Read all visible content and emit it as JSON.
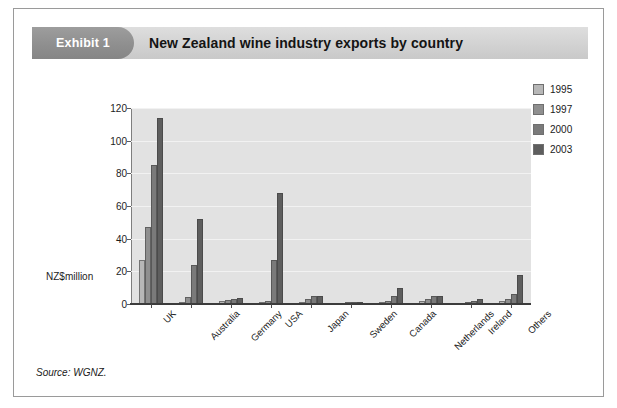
{
  "exhibit": {
    "badge_label": "Exhibit 1",
    "title": "New Zealand wine industry exports by country",
    "source": "Source: WGNZ."
  },
  "chart_data": {
    "type": "bar",
    "title": "New Zealand wine industry exports by country",
    "xlabel": "",
    "ylabel": "NZ$million",
    "ylim": [
      0,
      120
    ],
    "yticks": [
      0,
      20,
      40,
      60,
      80,
      100,
      120
    ],
    "grid": true,
    "legend_position": "right",
    "categories": [
      "UK",
      "Australia",
      "Germany",
      "USA",
      "Japan",
      "Sweden",
      "Canada",
      "Netherlands",
      "Ireland",
      "Others"
    ],
    "series": [
      {
        "name": "1995",
        "color": "#b7b7b7",
        "values": [
          27,
          1.5,
          2,
          1.5,
          1,
          0.5,
          1,
          2,
          0.5,
          2
        ]
      },
      {
        "name": "1997",
        "color": "#8f8f8f",
        "values": [
          47,
          4,
          2.5,
          2,
          3,
          1,
          2,
          3,
          1,
          3
        ]
      },
      {
        "name": "2000",
        "color": "#7a7a7a",
        "values": [
          85,
          24,
          3,
          27,
          5,
          1.5,
          5,
          5,
          2,
          6
        ]
      },
      {
        "name": "2003",
        "color": "#5e5e5e",
        "values": [
          114,
          52,
          3.5,
          68,
          5,
          1.5,
          10,
          5,
          3,
          18
        ]
      }
    ]
  },
  "legend": {
    "items": [
      {
        "label": "1995"
      },
      {
        "label": "1997"
      },
      {
        "label": "2000"
      },
      {
        "label": "2003"
      }
    ]
  }
}
